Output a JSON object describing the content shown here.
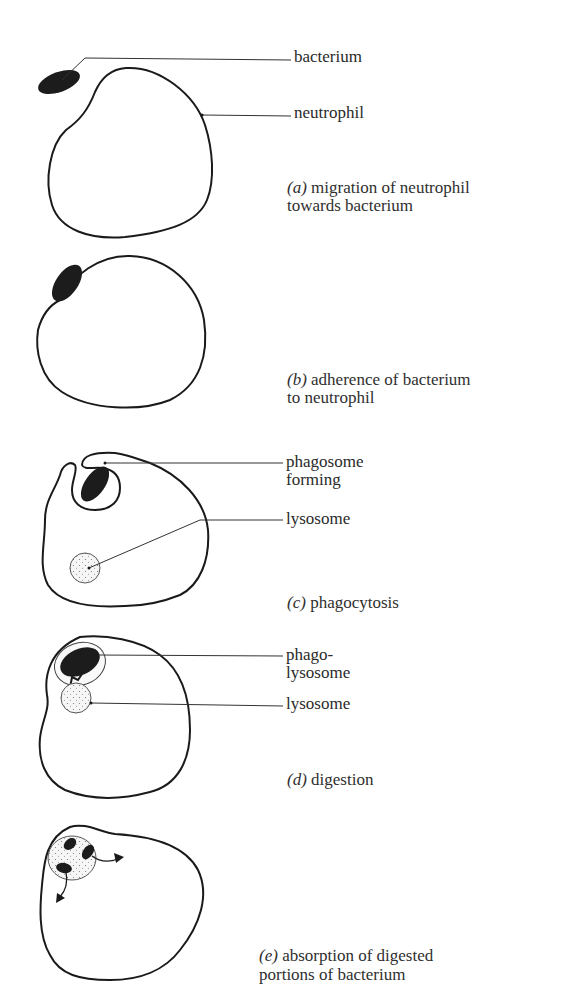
{
  "figure": {
    "colors": {
      "outline": "#1a1a1a",
      "bacterium_fill": "#1c1c1c",
      "lysosome_fill": "#f4f4f4",
      "text": "#2a2a2a",
      "background": "#ffffff"
    },
    "panels": [
      {
        "id": "a",
        "letter": "(a)",
        "caption_line1": "migration of neutrophil",
        "caption_line2": "towards bacterium",
        "labels": [
          "bacterium",
          "neutrophil"
        ]
      },
      {
        "id": "b",
        "letter": "(b)",
        "caption_line1": "adherence of bacterium",
        "caption_line2": "to neutrophil",
        "labels": []
      },
      {
        "id": "c",
        "letter": "(c)",
        "caption_line1": "phagocytosis",
        "caption_line2": "",
        "labels": [
          "phagosome",
          "forming",
          "lysosome"
        ]
      },
      {
        "id": "d",
        "letter": "(d)",
        "caption_line1": "digestion",
        "caption_line2": "",
        "labels": [
          "phago-",
          "lysosome",
          "lysosome"
        ]
      },
      {
        "id": "e",
        "letter": "(e)",
        "caption_line1": "absorption of digested",
        "caption_line2": "portions of bacterium",
        "labels": []
      }
    ]
  }
}
